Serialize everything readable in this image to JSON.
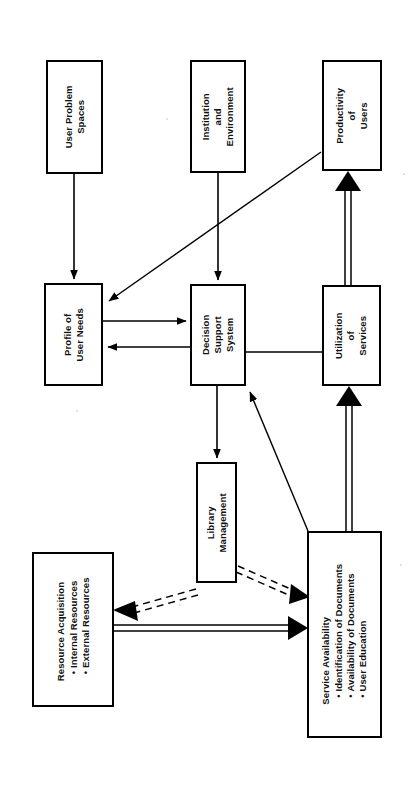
{
  "diagram": {
    "type": "flowchart",
    "orientation": "rotated-90-ccw",
    "colors": {
      "stroke": "#000000",
      "fill": "#ffffff",
      "background": "#ffffff"
    },
    "nodes": [
      {
        "id": "user-problem-spaces",
        "title": "User Problem",
        "title2": "Spaces",
        "bullets": []
      },
      {
        "id": "institution-and-environment",
        "title": "Institution",
        "title2": "and",
        "title3": "Environment",
        "bullets": []
      },
      {
        "id": "productivity-of-users",
        "title": "Productivity",
        "title2": "of",
        "title3": "Users",
        "bullets": []
      },
      {
        "id": "profile-of-user-needs",
        "title": "Profile of",
        "title2": "User Needs",
        "bullets": []
      },
      {
        "id": "decision-support-system",
        "title": "Decision",
        "title2": "Support",
        "title3": "System",
        "bullets": []
      },
      {
        "id": "utilization-of-services",
        "title": "Utilization",
        "title2": "of",
        "title3": "Services",
        "bullets": []
      },
      {
        "id": "library-management",
        "title": "Library",
        "title2": "Management",
        "bullets": []
      },
      {
        "id": "resource-acquisition",
        "title": "Resource Acquisition",
        "bullets": [
          "Internal Resources",
          "External Resources"
        ]
      },
      {
        "id": "service-availability",
        "title": "Service Availability",
        "bullets": [
          "Identification of  Documents",
          "Availability of Documents",
          "User Education"
        ]
      }
    ],
    "edges": [
      {
        "id": "e1",
        "from": "user-problem-spaces",
        "to": "profile-of-user-needs",
        "style": "solid-single",
        "arrow": "to"
      },
      {
        "id": "e2",
        "from": "institution-and-environment",
        "to": "decision-support-system",
        "style": "solid-single",
        "arrow": "to"
      },
      {
        "id": "e3",
        "from": "productivity-of-users",
        "to": "profile-of-user-needs",
        "style": "solid-single-diagonal",
        "arrow": "to"
      },
      {
        "id": "e4",
        "from": "profile-of-user-needs",
        "to": "decision-support-system",
        "style": "solid-single",
        "arrow": "to"
      },
      {
        "id": "e5",
        "from": "decision-support-system",
        "to": "profile-of-user-needs",
        "style": "solid-single",
        "arrow": "to"
      },
      {
        "id": "e6",
        "from": "decision-support-system",
        "to": "utilization-of-services",
        "style": "solid-single",
        "arrow": "none"
      },
      {
        "id": "e7",
        "from": "decision-support-system",
        "to": "library-management",
        "style": "solid-single",
        "arrow": "to"
      },
      {
        "id": "e8",
        "from": "service-availability",
        "to": "decision-support-system",
        "style": "solid-single-diagonal",
        "arrow": "to"
      },
      {
        "id": "e9",
        "from": "service-availability",
        "to": "utilization-of-services",
        "style": "double-solid",
        "arrow": "to"
      },
      {
        "id": "e10",
        "from": "utilization-of-services",
        "to": "productivity-of-users",
        "style": "double-solid",
        "arrow": "to"
      },
      {
        "id": "e11",
        "from": "library-management",
        "to": "resource-acquisition",
        "style": "double-dashed",
        "arrow": "to"
      },
      {
        "id": "e12",
        "from": "library-management",
        "to": "service-availability",
        "style": "double-dashed",
        "arrow": "to"
      },
      {
        "id": "e13",
        "from": "resource-acquisition",
        "to": "service-availability",
        "style": "double-solid",
        "arrow": "to"
      }
    ]
  }
}
